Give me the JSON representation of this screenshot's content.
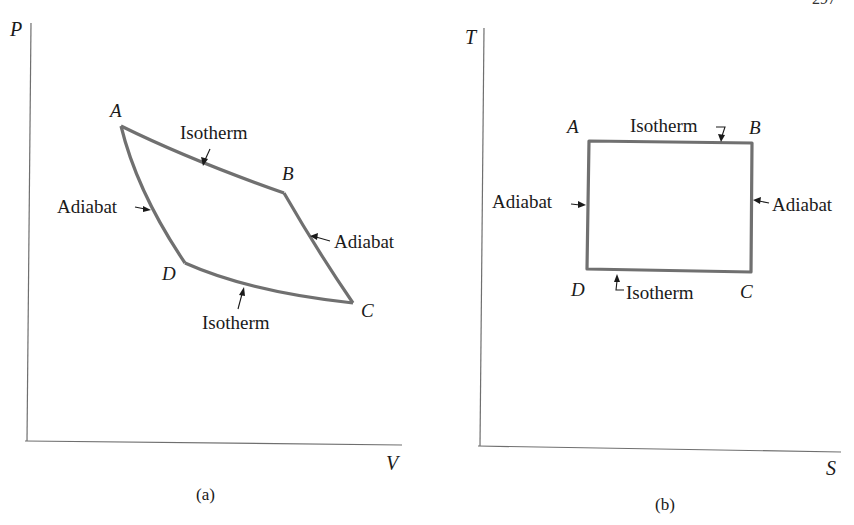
{
  "page": {
    "page_number_partial": "297"
  },
  "panels": {
    "a": {
      "caption": "(a)",
      "y_axis_label": "P",
      "x_axis_label": "V",
      "points": {
        "A": "A",
        "B": "B",
        "C": "C",
        "D": "D"
      },
      "labels": {
        "isotherm_top": "Isotherm",
        "isotherm_bottom": "Isotherm",
        "adiabat_left": "Adiabat",
        "adiabat_right": "Adiabat"
      }
    },
    "b": {
      "caption": "(b)",
      "y_axis_label": "T",
      "x_axis_label": "S",
      "points": {
        "A": "A",
        "B": "B",
        "C": "C",
        "D": "D"
      },
      "labels": {
        "isotherm_top": "Isotherm",
        "isotherm_bottom": "Isotherm",
        "adiabat_left": "Adiabat",
        "adiabat_right": "Adiabat"
      }
    }
  },
  "colors": {
    "curve": "#707070",
    "axis": "#6f6f6f",
    "text": "#1a1a1a"
  }
}
